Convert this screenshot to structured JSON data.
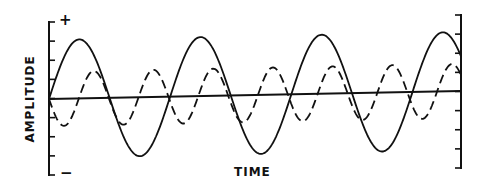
{
  "chart_data": {
    "type": "line",
    "title": "",
    "xlabel": "TIME",
    "ylabel": "AMPLITUDE",
    "y_top_marker": "+",
    "y_bottom_marker": "-",
    "grid": false,
    "legend": null,
    "axis_ticks": {
      "left_count": 9,
      "right_count": 9
    },
    "series": [
      {
        "name": "fundamental",
        "style": "solid",
        "shape": "sine",
        "start_phase": "rising from zero",
        "cycles_shown": 3.4,
        "relative_amplitude": 1.0,
        "relative_frequency": 1
      },
      {
        "name": "second harmonic",
        "style": "dashed",
        "shape": "sine",
        "start_phase": "falling from zero (inverted)",
        "cycles_shown": 6.9,
        "relative_amplitude": 0.46,
        "relative_frequency": 2
      },
      {
        "name": "baseline",
        "style": "solid",
        "shape": "line",
        "description": "zero-amplitude reference, slight upward slope"
      }
    ]
  },
  "labels": {
    "xlabel": "TIME",
    "ylabel": "AMPLITUDE",
    "plus": "+",
    "minus": "−"
  },
  "colors": {
    "ink": "#111111",
    "background": "#ffffff"
  }
}
